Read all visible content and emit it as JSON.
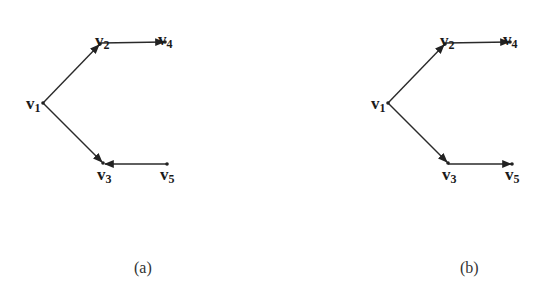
{
  "figure": {
    "panels": [
      {
        "id": "a",
        "caption": "(a)",
        "vertices": [
          {
            "id": "v1",
            "label": "v",
            "sub": "1",
            "x": 43,
            "y": 103
          },
          {
            "id": "v2",
            "label": "v",
            "sub": "2",
            "x": 100,
            "y": 44
          },
          {
            "id": "v3",
            "label": "v",
            "sub": "3",
            "x": 103,
            "y": 163
          },
          {
            "id": "v4",
            "label": "v",
            "sub": "4",
            "x": 165,
            "y": 42
          },
          {
            "id": "v5",
            "label": "v",
            "sub": "5",
            "x": 167,
            "y": 164
          }
        ],
        "edges": [
          {
            "from": "v1",
            "to": "v2",
            "directed": true
          },
          {
            "from": "v2",
            "to": "v4",
            "directed": true
          },
          {
            "from": "v1",
            "to": "v3",
            "directed": true
          },
          {
            "from": "v5",
            "to": "v3",
            "directed": true
          }
        ]
      },
      {
        "id": "b",
        "caption": "(b)",
        "vertices": [
          {
            "id": "v1",
            "label": "v",
            "sub": "1",
            "x": 388,
            "y": 103
          },
          {
            "id": "v2",
            "label": "v",
            "sub": "2",
            "x": 445,
            "y": 44
          },
          {
            "id": "v3",
            "label": "v",
            "sub": "3",
            "x": 448,
            "y": 163
          },
          {
            "id": "v4",
            "label": "v",
            "sub": "4",
            "x": 510,
            "y": 42
          },
          {
            "id": "v5",
            "label": "v",
            "sub": "5",
            "x": 512,
            "y": 164
          }
        ],
        "edges": [
          {
            "from": "v1",
            "to": "v2",
            "directed": true
          },
          {
            "from": "v2",
            "to": "v4",
            "directed": true
          },
          {
            "from": "v1",
            "to": "v3",
            "directed": true
          },
          {
            "from": "v3",
            "to": "v5",
            "directed": true
          }
        ]
      }
    ]
  }
}
